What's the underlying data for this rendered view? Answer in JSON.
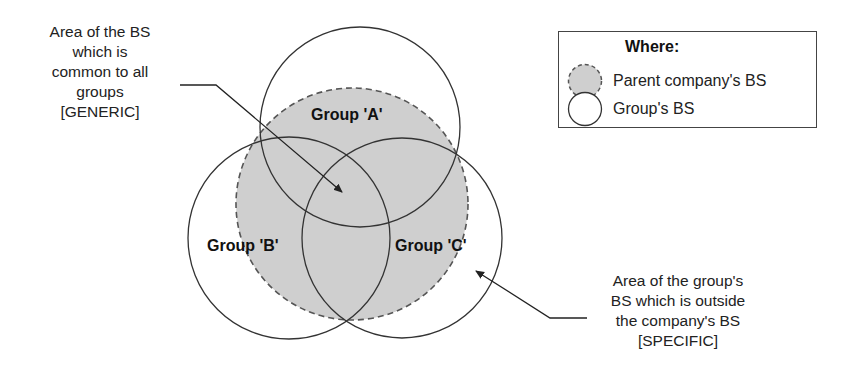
{
  "colors": {
    "parent_fill": "#cfcfcf",
    "parent_stroke": "#555555",
    "group_stroke": "#333333",
    "background": "#ffffff"
  },
  "callouts": {
    "generic": {
      "lines": [
        "Area of the BS",
        "which is",
        "common to all",
        "groups",
        "[GENERIC]"
      ]
    },
    "specific": {
      "lines": [
        "Area of the group's",
        "BS which is outside",
        "the company's BS",
        "[SPECIFIC]"
      ]
    }
  },
  "groups": {
    "a": {
      "label": "Group 'A'"
    },
    "b": {
      "label": "Group 'B'"
    },
    "c": {
      "label": "Group 'C'"
    }
  },
  "legend": {
    "title": "Where:",
    "items": [
      {
        "icon": "dashed-filled-circle-icon",
        "label": "Parent company's BS"
      },
      {
        "icon": "outline-circle-icon",
        "label": "Group's BS"
      }
    ]
  }
}
